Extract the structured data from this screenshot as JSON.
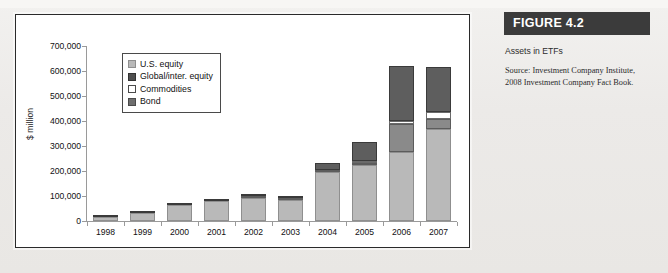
{
  "figure": {
    "header": "FIGURE 4.2",
    "title": "Assets in ETFs",
    "source": "Source: Investment Company Institute, 2008 Investment Company Fact Book."
  },
  "colors": {
    "us_equity": "#b9b9b9",
    "global_equity": "#5e5e5e",
    "commodities": "#ffffff",
    "bond": "#8a8a8a",
    "header_bg": "#3b3b3b",
    "axis": "#9a9a9a",
    "frame": "#2a2a2a"
  },
  "legend": {
    "items": [
      {
        "label": "U.S. equity",
        "key": "us_equity"
      },
      {
        "label": "Global/inter. equity",
        "key": "global_equity"
      },
      {
        "label": "Commodities",
        "key": "commodities"
      },
      {
        "label": "Bond",
        "key": "bond"
      }
    ]
  },
  "chart_data": {
    "type": "bar",
    "stacked": true,
    "title": "Assets in ETFs",
    "xlabel": "",
    "ylabel": "$ million",
    "ylim": [
      0,
      700000
    ],
    "yticks": [
      0,
      100000,
      200000,
      300000,
      400000,
      500000,
      600000,
      700000
    ],
    "ytick_labels": [
      "0",
      "100,000",
      "200,000",
      "300,000",
      "400,000",
      "500,000",
      "600,000",
      "700,000"
    ],
    "grid": false,
    "legend_position": "upper-left-inset",
    "categories": [
      "1998",
      "1999",
      "2000",
      "2001",
      "2002",
      "2003",
      "2004",
      "2005",
      "2006",
      "2007"
    ],
    "series": [
      {
        "name": "U.S. equity",
        "values": [
          15000,
          33000,
          65000,
          80000,
          92000,
          85000,
          196000,
          224000,
          276000,
          368000
        ]
      },
      {
        "name": "Bond",
        "values": [
          0,
          0,
          0,
          0,
          3000,
          4000,
          5000,
          6000,
          114000,
          40000
        ]
      },
      {
        "name": "Commodities",
        "values": [
          0,
          0,
          0,
          0,
          0,
          0,
          0,
          4000,
          10000,
          28000
        ]
      },
      {
        "name": "Global/inter. equity",
        "values": [
          1000,
          3000,
          3000,
          3000,
          8000,
          9000,
          30000,
          76000,
          220000,
          182000
        ]
      }
    ],
    "totals": [
      16000,
      36000,
      68000,
      83000,
      103000,
      98000,
      231000,
      310000,
      620000,
      618000
    ]
  }
}
